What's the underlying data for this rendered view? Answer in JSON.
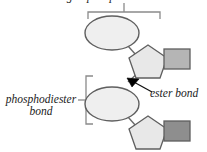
{
  "figure": {
    "title_clipped_top": "sugar-phosphate backbone",
    "clipped_left_fragment": "te",
    "background_color": "#ffffff",
    "width": 207,
    "height": 152
  },
  "labels": {
    "phosphodiester_line1": "phosphodiester",
    "phosphodiester_line2": "bond",
    "ester_bond": "ester bond"
  },
  "colors": {
    "outline": "#595959",
    "phosphate_fill": "#ededed",
    "sugar_fill": "#e6e6e6",
    "base_top_fill": "#b5b5b5",
    "base_bottom_fill": "#8e8e8e",
    "bracket": "#8a8a8a",
    "arrow": "#000000",
    "text": "#1b1b1b"
  },
  "shapes": {
    "phosphate_top": {
      "name": "phosphate-group",
      "cx": 112,
      "cy": 33,
      "rx": 26,
      "ry": 17
    },
    "phosphate_bottom": {
      "name": "phosphate-group",
      "cx": 112,
      "cy": 104,
      "rx": 26,
      "ry": 17
    },
    "sugar_top": {
      "name": "sugar-ring",
      "cx": 148,
      "cy": 60
    },
    "sugar_bottom": {
      "name": "sugar-ring",
      "cx": 148,
      "cy": 131
    },
    "base_top": {
      "name": "nitrogenous-base",
      "x": 164,
      "y": 49,
      "w": 24,
      "h": 19
    },
    "base_bottom": {
      "name": "nitrogenous-base",
      "x": 164,
      "y": 121,
      "w": 24,
      "h": 19
    }
  },
  "brackets": {
    "top": {
      "name": "backbone-bracket",
      "x1": 88,
      "x2": 160,
      "y": 12,
      "tick_x": 124
    },
    "left": {
      "name": "phosphodiester-bracket",
      "y1": 76,
      "y2": 124,
      "x": 86,
      "tick_y": 100
    }
  },
  "annotations": {
    "ester_arrow": {
      "name": "ester-bond-arrow",
      "tip_x": 128,
      "tip_y": 79,
      "tail_x": 152,
      "tail_y": 92
    }
  }
}
